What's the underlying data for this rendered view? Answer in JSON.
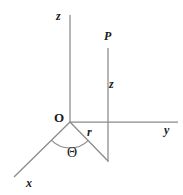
{
  "figure": {
    "background_color": "#ffffff",
    "line_color": "#8a8a8a",
    "label_color": "#1a1a1a",
    "labels": {
      "z_axis": "z",
      "point_p": "P",
      "z_coordinate": "z",
      "origin": "O",
      "radius": "r",
      "y_axis": "y",
      "x_axis": "x",
      "theta": "Θ"
    }
  },
  "geometry": {
    "origin": {
      "x": 70,
      "y": 122
    },
    "z_axis": {
      "x1": 70,
      "y1": 15,
      "x2": 70,
      "y2": 122
    },
    "y_axis": {
      "x1": 70,
      "y1": 122,
      "x2": 178,
      "y2": 122
    },
    "x_axis": {
      "x1": 70,
      "y1": 122,
      "x2": 14,
      "y2": 177
    },
    "p_drop_line": {
      "x1": 108,
      "y1": 48,
      "x2": 108,
      "y2": 161
    },
    "radius_line": {
      "x1": 70,
      "y1": 122,
      "x2": 108,
      "y2": 161
    },
    "angle_arc": {
      "cx": 70,
      "cy": 122,
      "radius": 26,
      "from_deg": 135,
      "to_deg": 45
    }
  }
}
